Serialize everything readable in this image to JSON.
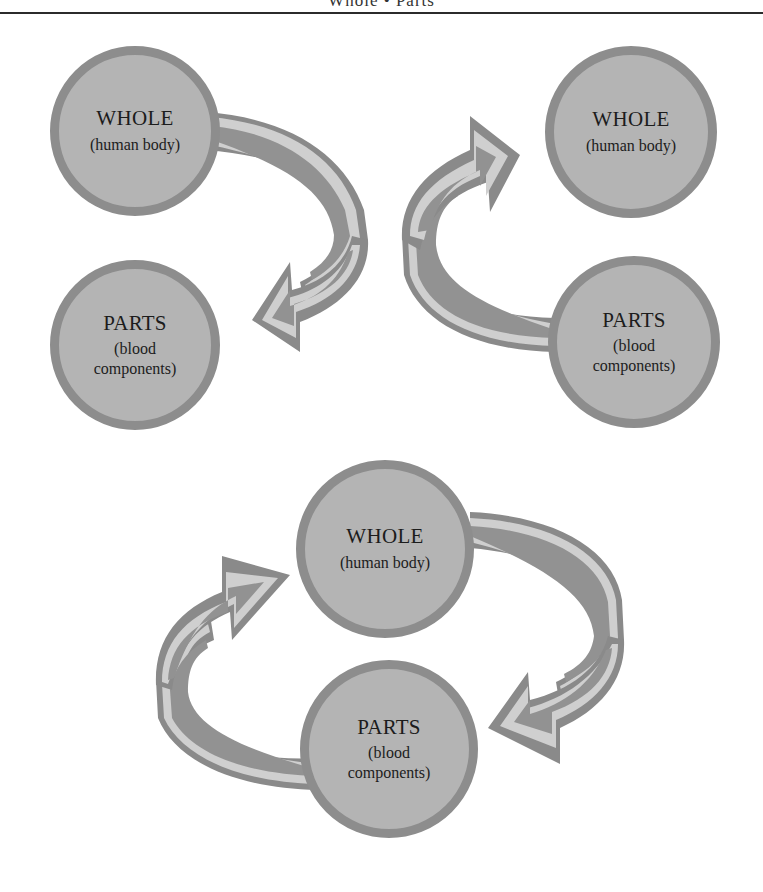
{
  "header": {
    "title": "Whole • Parts"
  },
  "colors": {
    "circle_fill": "#b4b4b4",
    "circle_ring": "#8d8d8d",
    "arrow_outline": "#8a8a8a",
    "arrow_band": "#cfcfcf",
    "arrow_core": "#929292",
    "rule": "#2b2b2b"
  },
  "diagrams": [
    {
      "name": "top-left",
      "direction": "whole-to-parts",
      "whole": {
        "label": "WHOLE",
        "sub": "(human body)"
      },
      "parts": {
        "label": "PARTS",
        "sub1": "(blood",
        "sub2": "components)"
      }
    },
    {
      "name": "top-right",
      "direction": "parts-to-whole",
      "whole": {
        "label": "WHOLE",
        "sub": "(human body)"
      },
      "parts": {
        "label": "PARTS",
        "sub1": "(blood",
        "sub2": "components)"
      }
    },
    {
      "name": "bottom",
      "direction": "cycle",
      "whole": {
        "label": "WHOLE",
        "sub": "(human body)"
      },
      "parts": {
        "label": "PARTS",
        "sub1": "(blood",
        "sub2": "components)"
      }
    }
  ]
}
